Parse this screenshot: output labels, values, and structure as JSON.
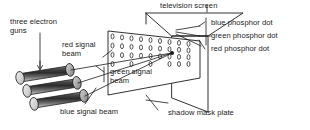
{
  "diagram": {
    "background_color": "#ffffff",
    "line_color": "#1b1b1b",
    "text_color": "#1b1b1b"
  },
  "labels": {
    "three_electron_guns": "three electron\nguns",
    "red_signal_beam": "red signal\nbeam",
    "green_signal_beam": "green signal\nbeam",
    "blue_signal_beam": "blue signal beam",
    "television_screen": "television screen",
    "shadow_mask_plate": "shadow mask plate",
    "blue_phosphor_dot": "blue phosphor dot",
    "green_phosphor_dot": "green phosphor dot",
    "red_phosphor_dot": "red phosphor dot"
  },
  "components": {
    "electron_guns": {
      "name": "three electron guns",
      "count": 3,
      "shape": "cylinder",
      "fill": "grey-gradient"
    },
    "shadow_mask_plate": {
      "name": "shadow mask plate",
      "hole_rows": 4,
      "hole_columns": 9,
      "hole_shape": "ellipse"
    },
    "television_screen": {
      "name": "television screen",
      "shape": "box"
    },
    "beams": [
      {
        "name": "red signal beam",
        "color_label": "red"
      },
      {
        "name": "green signal beam",
        "color_label": "green"
      },
      {
        "name": "blue signal beam",
        "color_label": "blue"
      }
    ],
    "phosphor_dots": [
      {
        "name": "blue phosphor dot"
      },
      {
        "name": "green phosphor dot"
      },
      {
        "name": "red phosphor dot"
      }
    ]
  }
}
